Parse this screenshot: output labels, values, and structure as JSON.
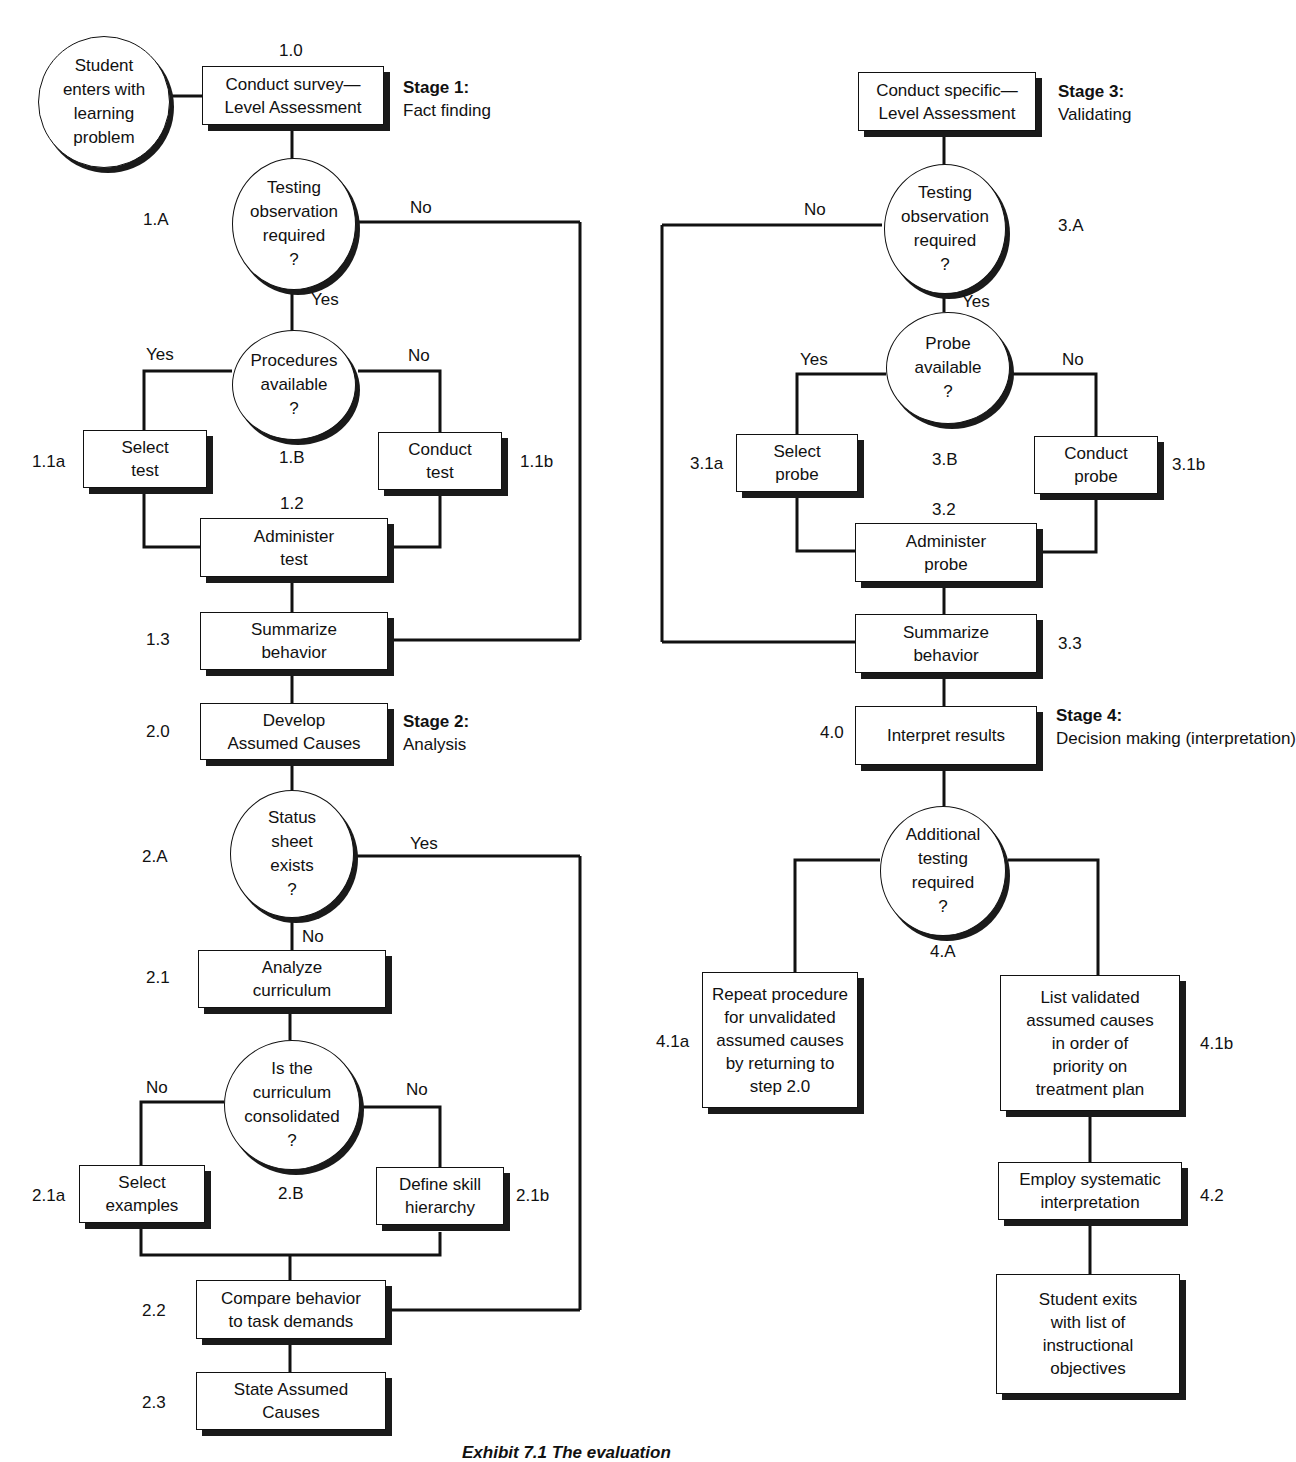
{
  "start": {
    "text": "Student\nenters with\nlearning\nproblem"
  },
  "stages": [
    {
      "title": "Stage 1:",
      "subtitle": "Fact finding"
    },
    {
      "title": "Stage 2:",
      "subtitle": "Analysis"
    },
    {
      "title": "Stage 3:",
      "subtitle": "Validating"
    },
    {
      "title": "Stage 4:",
      "subtitle": "Decision making\n(interpretation)"
    }
  ],
  "nodes": {
    "n1_0": {
      "id": "1.0",
      "text": "Conduct survey—\nLevel Assessment"
    },
    "n1_A": {
      "id": "1.A",
      "text": "Testing\nobservation\nrequired\n?"
    },
    "n1_B": {
      "id": "1.B",
      "text": "Procedures\navailable\n?"
    },
    "n1_1a": {
      "id": "1.1a",
      "text": "Select\ntest"
    },
    "n1_1b": {
      "id": "1.1b",
      "text": "Conduct\ntest"
    },
    "n1_2": {
      "id": "1.2",
      "text": "Administer\ntest"
    },
    "n1_3": {
      "id": "1.3",
      "text": "Summarize\nbehavior"
    },
    "n2_0": {
      "id": "2.0",
      "text": "Develop\nAssumed Causes"
    },
    "n2_A": {
      "id": "2.A",
      "text": "Status\nsheet\nexists\n?"
    },
    "n2_1": {
      "id": "2.1",
      "text": "Analyze\ncurriculum"
    },
    "n2_B": {
      "id": "2.B",
      "text": "Is the\ncurriculum\nconsolidated\n?"
    },
    "n2_1a": {
      "id": "2.1a",
      "text": "Select\nexamples"
    },
    "n2_1b": {
      "id": "2.1b",
      "text": "Define skill\nhierarchy"
    },
    "n2_2": {
      "id": "2.2",
      "text": "Compare behavior\nto task demands"
    },
    "n2_3": {
      "id": "2.3",
      "text": "State Assumed\nCauses"
    },
    "n3_0": {
      "text": "Conduct specific—\nLevel Assessment"
    },
    "n3_A": {
      "id": "3.A",
      "text": "Testing\nobservation\nrequired\n?"
    },
    "n3_B": {
      "id": "3.B",
      "text": "Probe\navailable\n?"
    },
    "n3_1a": {
      "id": "3.1a",
      "text": "Select\nprobe"
    },
    "n3_1b": {
      "id": "3.1b",
      "text": "Conduct\nprobe"
    },
    "n3_2": {
      "id": "3.2",
      "text": "Administer\nprobe"
    },
    "n3_3": {
      "id": "3.3",
      "text": "Summarize\nbehavior"
    },
    "n4_0": {
      "id": "4.0",
      "text": "Interpret results"
    },
    "n4_A": {
      "id": "4.A",
      "text": "Additional\ntesting\nrequired\n?"
    },
    "n4_1a": {
      "id": "4.1a",
      "text": "Repeat procedure\nfor unvalidated\nassumed causes\nby returning to\nstep 2.0"
    },
    "n4_1b": {
      "id": "4.1b",
      "text": "List validated\nassumed causes\nin order of\npriority on\ntreatment plan"
    },
    "n4_2": {
      "id": "4.2",
      "text": "Employ systematic\ninterpretation"
    },
    "end": {
      "text": "Student exits\nwith list of\ninstructional\nobjectives"
    }
  },
  "edge_labels": {
    "yes": "Yes",
    "no": "No"
  },
  "caption": "Exhibit 7.1    The evaluation"
}
